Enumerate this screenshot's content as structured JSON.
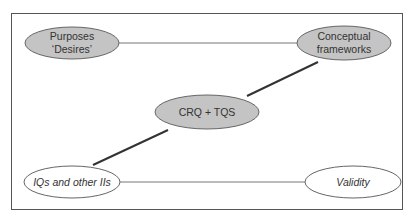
{
  "diagram": {
    "nodes": [
      {
        "id": "purposes",
        "lines": [
          "Purposes",
          "‘Desires’"
        ],
        "style": "filled",
        "cx": 72,
        "cy": 43
      },
      {
        "id": "conceptual",
        "lines": [
          "Conceptual",
          "frameworks"
        ],
        "style": "filled",
        "cx": 344,
        "cy": 43
      },
      {
        "id": "crq",
        "lines": [
          "CRQ + TQS"
        ],
        "style": "filled",
        "cx": 207,
        "cy": 112
      },
      {
        "id": "iqs",
        "lines": [
          "IQs and other IIs"
        ],
        "style": "outline-italic",
        "cx": 72,
        "cy": 182
      },
      {
        "id": "validity",
        "lines": [
          "Validity"
        ],
        "style": "outline-italic",
        "cx": 353,
        "cy": 182
      }
    ],
    "edges": [
      {
        "from": "purposes",
        "to": "conceptual",
        "weight": "thin"
      },
      {
        "from": "conceptual",
        "to": "crq",
        "weight": "thick"
      },
      {
        "from": "crq",
        "to": "iqs",
        "weight": "thick"
      },
      {
        "from": "iqs",
        "to": "validity",
        "weight": "thin"
      }
    ],
    "colors": {
      "fill": "#c4c4c4",
      "stroke": "#555555",
      "frame": "#555555"
    }
  }
}
